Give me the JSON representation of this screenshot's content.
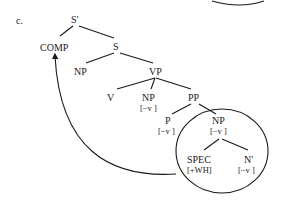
{
  "figure": {
    "label": "c.",
    "nodes": {
      "s_bar": "S'",
      "comp": "COMP",
      "s": "S",
      "np_subj": "NP",
      "vp": "VP",
      "v": "V",
      "np_obj": "NP",
      "np_obj_feat": "[−v ]",
      "pp": "PP",
      "p": "P",
      "p_feat": "[−v ]",
      "np_pp": "NP",
      "np_pp_feat": "[−v ]",
      "spec": "SPEC",
      "spec_feat": "[+WH]",
      "n_bar": "N'",
      "n_bar_feat": "[−v ]"
    },
    "colors": {
      "ink": "#1a1a1a",
      "background": "#ffffff"
    }
  }
}
